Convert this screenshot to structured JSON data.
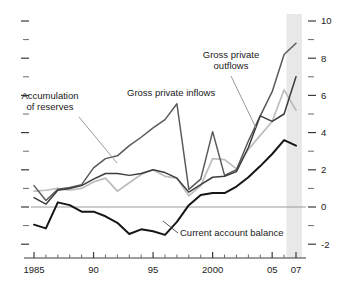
{
  "chart_data": {
    "type": "line",
    "title": "",
    "subtitle": "",
    "xlabel": "",
    "ylabel": "",
    "xlim": [
      1985,
      2007
    ],
    "ylim": [
      -2.6,
      10.4
    ],
    "grid": false,
    "legend_position": "inline-annotations",
    "zero_line": 0,
    "x_tick_labels": [
      "1985",
      "90",
      "95",
      "2000",
      "05",
      "07"
    ],
    "x_tick_values": [
      1985,
      1990,
      1995,
      2000,
      2005,
      2007
    ],
    "x_minor_ticks": [
      1986,
      1987,
      1988,
      1989,
      1991,
      1992,
      1993,
      1994,
      1996,
      1997,
      1998,
      1999,
      2001,
      2002,
      2003,
      2004,
      2006
    ],
    "y_tick_labels": [
      "10",
      "8",
      "6",
      "4",
      "2",
      "0",
      "-2"
    ],
    "y_tick_values": [
      10,
      8,
      6,
      4,
      2,
      0,
      -2
    ],
    "y_minor_ticks": [
      9,
      7,
      5,
      3,
      1,
      -1
    ],
    "shaded_band": {
      "from": 2006.2,
      "to": 2007.5,
      "color": "#e8e8e8"
    },
    "x": [
      1985,
      1986,
      1987,
      1988,
      1989,
      1990,
      1991,
      1992,
      1993,
      1994,
      1995,
      1996,
      1997,
      1998,
      1999,
      2000,
      2001,
      2002,
      2003,
      2004,
      2005,
      2006,
      2007
    ],
    "series": [
      {
        "name": "Gross private inflows",
        "color": "#5a5a5a",
        "width": 1.5,
        "values": [
          1.15,
          0.35,
          0.95,
          1.05,
          1.2,
          2.1,
          2.6,
          2.75,
          3.3,
          3.75,
          4.25,
          4.7,
          5.55,
          0.95,
          1.5,
          4.05,
          1.7,
          2.0,
          3.55,
          4.9,
          6.2,
          8.2,
          8.8
        ]
      },
      {
        "name": "Gross private outflows",
        "color": "#3c3c3c",
        "width": 1.5,
        "values": [
          0.5,
          0.15,
          0.9,
          1.0,
          1.15,
          1.5,
          1.8,
          1.8,
          1.7,
          1.8,
          2.0,
          1.85,
          1.55,
          0.8,
          1.2,
          1.6,
          1.65,
          1.9,
          3.2,
          4.9,
          4.6,
          5.0,
          7.0
        ]
      },
      {
        "name": "Accumulation of reserves",
        "color": "#bdbdbd",
        "width": 1.7,
        "values": [
          0.85,
          0.9,
          1.0,
          0.9,
          1.0,
          1.35,
          1.55,
          0.85,
          1.3,
          1.75,
          2.0,
          1.65,
          1.55,
          0.6,
          1.15,
          2.6,
          2.55,
          2.05,
          3.1,
          3.85,
          4.6,
          6.3,
          5.2
        ]
      },
      {
        "name": "Current account balance",
        "color": "#161616",
        "width": 2.0,
        "values": [
          -0.95,
          -1.15,
          0.25,
          0.1,
          -0.25,
          -0.25,
          -0.5,
          -0.85,
          -1.45,
          -1.2,
          -1.3,
          -1.5,
          -0.8,
          0.1,
          0.65,
          0.75,
          0.75,
          1.1,
          1.6,
          2.2,
          2.85,
          3.6,
          3.3
        ]
      }
    ],
    "annotations": [
      {
        "name": "accumulation-of-reserves",
        "text_lines": [
          "Accumulation",
          "of reserves"
        ],
        "text_x": 50,
        "text_y": 99,
        "anchor": "middle",
        "leader": {
          "x1": 79,
          "y1": 117,
          "x2": 117,
          "y2": 163,
          "color": "#9a9a9a"
        }
      },
      {
        "name": "gross-private-inflows",
        "text_lines": [
          "Gross private inflows"
        ],
        "text_x": 127,
        "text_y": 96,
        "anchor": "start",
        "leader": null
      },
      {
        "name": "gross-private-outflows",
        "text_lines": [
          "Gross private",
          "outflows"
        ],
        "text_x": 231,
        "text_y": 58,
        "anchor": "middle",
        "leader": {
          "x1": 231,
          "y1": 76,
          "x2": 256,
          "y2": 128,
          "color": "#9a9a9a"
        }
      },
      {
        "name": "current-account-balance",
        "text_lines": [
          "Current account balance"
        ],
        "text_x": 180,
        "text_y": 236,
        "anchor": "start",
        "leader": {
          "x1": 178,
          "y1": 233,
          "x2": 163,
          "y2": 221,
          "color": "#555555"
        }
      }
    ]
  }
}
